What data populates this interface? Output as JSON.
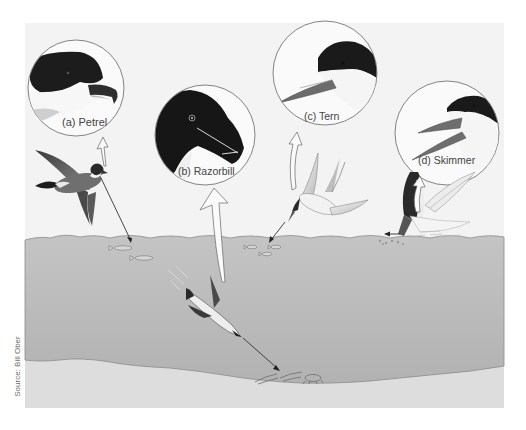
{
  "figure": {
    "credit": "Source: Bill Ober",
    "colors": {
      "panel_bg": "#f2f2f2",
      "water": "#b9b9b9",
      "seafloor": "#dcdcdc",
      "outline": "#555555",
      "bird_dark": "#1f1f1f",
      "beak": "#7a7a7a"
    },
    "birds": [
      {
        "id": "a",
        "label": "(a) Petrel",
        "name": "Petrel",
        "feeding": "surface-picking fish near surface"
      },
      {
        "id": "b",
        "label": "(b) Razorbill",
        "name": "Razorbill",
        "feeding": "pursuit diving to sea floor"
      },
      {
        "id": "c",
        "label": "(c) Tern",
        "name": "Tern",
        "feeding": "plunge diving into shallow fish school"
      },
      {
        "id": "d",
        "label": "(d) Skimmer",
        "name": "Skimmer",
        "feeding": "skimming water surface with lower bill"
      }
    ]
  }
}
